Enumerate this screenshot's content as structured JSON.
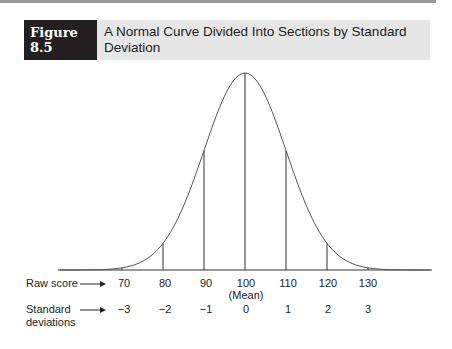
{
  "figure": {
    "label": "Figure 8.5",
    "title": "A Normal Curve Divided Into Sections by Standard Deviation"
  },
  "axis": {
    "raw_label": "Raw score",
    "sd_label_line1": "Standard",
    "sd_label_line2": "deviations",
    "mean_label": "(Mean)",
    "raw_ticks": [
      "70",
      "80",
      "90",
      "100",
      "110",
      "120",
      "130"
    ],
    "sd_ticks": [
      "−3",
      "−2",
      "−1",
      "0",
      "1",
      "2",
      "3"
    ]
  },
  "chart_data": {
    "type": "line",
    "title": "A Normal Curve Divided Into Sections by Standard Deviation",
    "x": [
      70,
      80,
      90,
      100,
      110,
      120,
      130
    ],
    "x_secondary": [
      -3,
      -2,
      -1,
      0,
      1,
      2,
      3
    ],
    "xlabel": "Raw score",
    "xlabel_secondary": "Standard deviations",
    "mean": 100,
    "sd": 10,
    "annotations": [
      "(Mean) under 100"
    ],
    "grid": false
  }
}
